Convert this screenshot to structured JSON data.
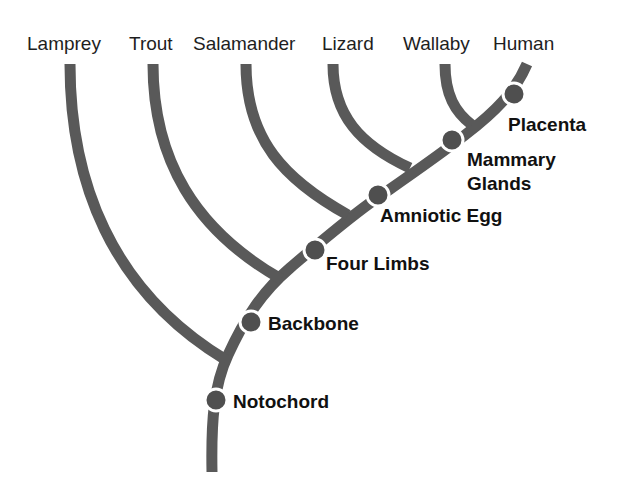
{
  "diagram": {
    "type": "cladogram",
    "line_color": "#595959",
    "node_color": "#4f4f4f",
    "taxa": [
      {
        "label": "Lamprey"
      },
      {
        "label": "Trout"
      },
      {
        "label": "Salamander"
      },
      {
        "label": "Lizard"
      },
      {
        "label": "Wallaby"
      },
      {
        "label": "Human"
      }
    ],
    "traits": [
      {
        "label": "Notochord"
      },
      {
        "label": "Backbone"
      },
      {
        "label": "Four Limbs"
      },
      {
        "label": "Amniotic Egg"
      },
      {
        "label": "Mammary Glands",
        "line1": "Mammary",
        "line2": "Glands"
      },
      {
        "label": "Placenta"
      }
    ]
  }
}
